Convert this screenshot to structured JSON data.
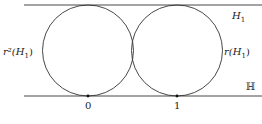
{
  "diagram": {
    "labels": {
      "top_line": "H",
      "top_line_sub": "1",
      "bottom_line": "ℍ",
      "left_circle": "r²(H",
      "left_circle_sub": "1",
      "left_circle_close": ")",
      "right_circle": "r(H",
      "right_circle_sub": "1",
      "right_circle_close": ")",
      "point_0": "0",
      "point_1": "1"
    },
    "colors": {
      "stroke": "#333333",
      "text": "#222222"
    }
  }
}
